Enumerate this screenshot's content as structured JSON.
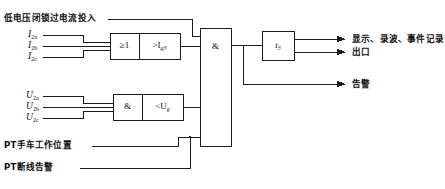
{
  "diagram": {
    "title_line": "低电压闭锁过电流投入",
    "background": "#ffffff",
    "line_color": "#1a1a1a",
    "inputs": {
      "current": [
        {
          "label": "I",
          "sub": "2a"
        },
        {
          "label": "I",
          "sub": "2b"
        },
        {
          "label": "I",
          "sub": "2c"
        }
      ],
      "voltage": [
        {
          "label": "U",
          "sub": "2a"
        },
        {
          "label": "U",
          "sub": "2b"
        },
        {
          "label": "U",
          "sub": "2c"
        }
      ],
      "bottom": [
        "PT手车工作位置",
        "PT断线告警"
      ]
    },
    "blocks": {
      "or_gate": "≥1",
      "overcurrent": ">I",
      "overcurrent_sub": "g3",
      "and_gate_v": "&",
      "undervoltage": "<U",
      "undervoltage_sub": "g",
      "main_and": "&",
      "timer": "t",
      "timer_sub": "3"
    },
    "outputs": [
      "显示、录波、事件记录",
      "出口",
      "告警"
    ]
  }
}
